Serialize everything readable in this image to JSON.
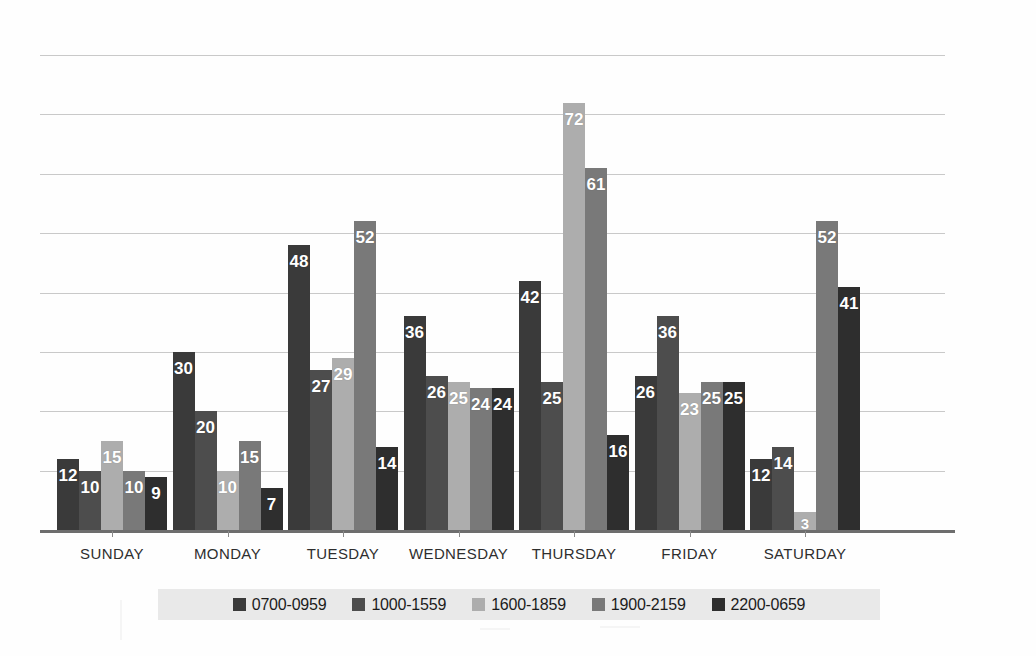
{
  "chart_data": {
    "type": "bar",
    "title": "",
    "xlabel": "",
    "ylabel": "",
    "ylim": [
      0,
      80
    ],
    "grid": true,
    "gridline_values": [
      10,
      20,
      30,
      40,
      50,
      60,
      70,
      80
    ],
    "legend_position": "bottom",
    "categories": [
      "SUNDAY",
      "MONDAY",
      "TUESDAY",
      "WEDNESDAY",
      "THURSDAY",
      "FRIDAY",
      "SATURDAY"
    ],
    "series": [
      {
        "name": "0700-0959",
        "color": "#3a3a3a",
        "values": [
          12,
          30,
          48,
          36,
          42,
          26,
          12
        ]
      },
      {
        "name": "1000-1559",
        "color": "#4d4d4d",
        "values": [
          10,
          20,
          27,
          26,
          25,
          36,
          14
        ]
      },
      {
        "name": "1600-1859",
        "color": "#adadad",
        "values": [
          15,
          10,
          29,
          25,
          72,
          23,
          3
        ]
      },
      {
        "name": "1900-2159",
        "color": "#797979",
        "values": [
          10,
          15,
          52,
          24,
          61,
          25,
          52
        ]
      },
      {
        "name": "2200-0659",
        "color": "#2e2e2e",
        "values": [
          9,
          7,
          14,
          24,
          16,
          25,
          41
        ]
      }
    ]
  },
  "axis": {
    "categories": [
      "SUNDAY",
      "MONDAY",
      "TUESDAY",
      "WEDNESDAY",
      "THURSDAY",
      "FRIDAY",
      "SATURDAY"
    ]
  },
  "legend": {
    "items": [
      {
        "label": "0700-0959",
        "color": "#3a3a3a"
      },
      {
        "label": "1000-1559",
        "color": "#4d4d4d"
      },
      {
        "label": "1600-1859",
        "color": "#adadad"
      },
      {
        "label": "1900-2159",
        "color": "#797979"
      },
      {
        "label": "2200-0659",
        "color": "#2e2e2e"
      }
    ]
  }
}
